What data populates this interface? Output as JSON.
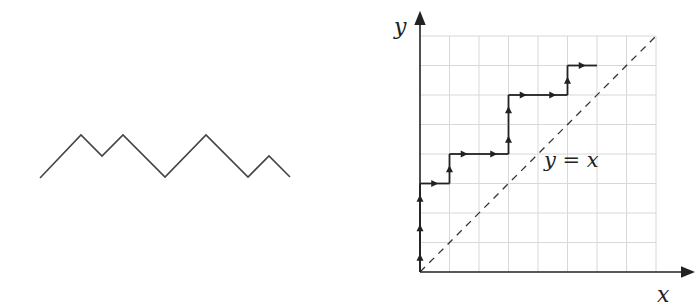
{
  "zigzag": {
    "points": [
      [
        40,
        178
      ],
      [
        81,
        135
      ],
      [
        102,
        156
      ],
      [
        123,
        135
      ],
      [
        165,
        177
      ],
      [
        206,
        135
      ],
      [
        248,
        177
      ],
      [
        269,
        156
      ],
      [
        290,
        177
      ]
    ],
    "stroke": "#444444"
  },
  "lattice": {
    "origin_px": [
      420,
      272
    ],
    "cell_px": 29.5,
    "grid_size": 8,
    "x_axis_label": "x",
    "y_axis_label": "y",
    "diagonal_label": "y = x",
    "path": [
      [
        0,
        0
      ],
      [
        0,
        1
      ],
      [
        0,
        2
      ],
      [
        0,
        3
      ],
      [
        1,
        3
      ],
      [
        1,
        4
      ],
      [
        2,
        4
      ],
      [
        3,
        4
      ],
      [
        3,
        5
      ],
      [
        3,
        6
      ],
      [
        4,
        6
      ],
      [
        5,
        6
      ],
      [
        5,
        7
      ],
      [
        6,
        7
      ]
    ],
    "grid_color": "#d8d8d8",
    "line_color": "#222222"
  }
}
